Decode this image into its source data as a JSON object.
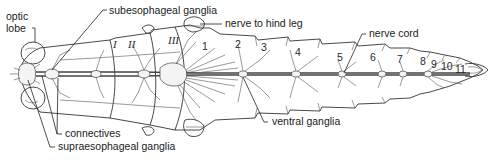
{
  "figure": {
    "labels": {
      "optic_lobe_1": "optic",
      "optic_lobe_2": "lobe",
      "subesophageal": "subesophageal ganglia",
      "nerve_hind_leg": "nerve to hind leg",
      "nerve_cord": "nerve cord",
      "ventral_ganglia": "ventral ganglia",
      "connectives": "connectives",
      "supraesophageal": "supraesophageal ganglia"
    },
    "thoracic_segments": [
      "I",
      "II",
      "III"
    ],
    "abdominal_segments": [
      "1",
      "2",
      "3",
      "4",
      "5",
      "6",
      "7",
      "8",
      "9",
      "10",
      "11"
    ],
    "colors": {
      "line": "#333333",
      "background": "#ffffff"
    }
  }
}
